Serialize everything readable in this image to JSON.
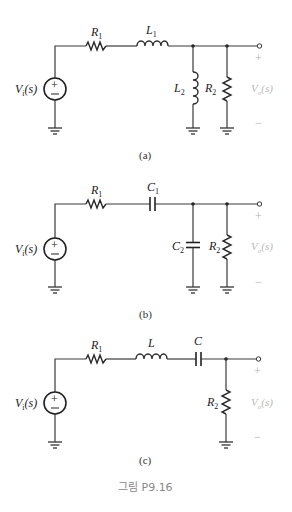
{
  "figure_caption": "그림 P9.16",
  "circuits": {
    "a": {
      "caption": "(a)",
      "source": {
        "label": "V",
        "sub": "i",
        "arg": "(s)",
        "plus": "+",
        "minus": "−"
      },
      "series": [
        {
          "label": "R",
          "sub": "1"
        },
        {
          "label": "L",
          "sub": "1"
        }
      ],
      "shunt": [
        {
          "label": "L",
          "sub": "2"
        },
        {
          "label": "R",
          "sub": "2"
        }
      ],
      "output": {
        "label": "V",
        "sub": "o",
        "arg": "(s)",
        "plus": "+",
        "minus": "−"
      }
    },
    "b": {
      "caption": "(b)",
      "source": {
        "label": "V",
        "sub": "i",
        "arg": "(s)",
        "plus": "+",
        "minus": "−"
      },
      "series": [
        {
          "label": "R",
          "sub": "1"
        },
        {
          "label": "C",
          "sub": "1"
        }
      ],
      "shunt": [
        {
          "label": "C",
          "sub": "2"
        },
        {
          "label": "R",
          "sub": "2"
        }
      ],
      "output": {
        "label": "V",
        "sub": "o",
        "arg": "(s)",
        "plus": "+",
        "minus": "−"
      }
    },
    "c": {
      "caption": "(c)",
      "source": {
        "label": "V",
        "sub": "i",
        "arg": "(s)",
        "plus": "+",
        "minus": "−"
      },
      "series": [
        {
          "label": "R",
          "sub": "1"
        },
        {
          "label": "L",
          "sub": ""
        },
        {
          "label": "C",
          "sub": ""
        }
      ],
      "shunt": [
        {
          "label": "R",
          "sub": "2"
        }
      ],
      "output": {
        "label": "V",
        "sub": "o",
        "arg": "(s)",
        "plus": "+",
        "minus": "−"
      }
    }
  }
}
